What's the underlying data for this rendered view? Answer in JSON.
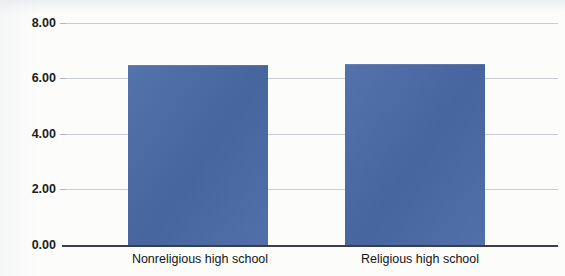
{
  "chart_data": {
    "type": "bar",
    "title": "",
    "title_partial": "",
    "xlabel": "",
    "ylabel": "",
    "categories": [
      "Nonreligious high school",
      "Religious high school"
    ],
    "values": [
      6.48,
      6.52
    ],
    "series": [
      {
        "name": "",
        "values": [
          6.48,
          6.52
        ]
      }
    ],
    "ylim": [
      0,
      8
    ],
    "y_ticks": [
      "0.00",
      "2.00",
      "4.00",
      "6.00",
      "8.00"
    ],
    "y_tick_values": [
      0,
      2,
      4,
      6,
      8
    ],
    "grid": true,
    "legend": false,
    "legend_position": "none",
    "bar_color": "#4a6aa6",
    "axis_color": "#3b3f44",
    "gridline_color": "#c9cdd2",
    "background_color": "#fcfcfb"
  },
  "axis": {
    "y_ticks": [
      {
        "label": "8.00",
        "value": 8
      },
      {
        "label": "6.00",
        "value": 6
      },
      {
        "label": "4.00",
        "value": 4
      },
      {
        "label": "2.00",
        "value": 2
      },
      {
        "label": "0.00",
        "value": 0
      }
    ],
    "x_categories": [
      {
        "label": "Nonreligious high school"
      },
      {
        "label": "Religious high school"
      }
    ]
  }
}
